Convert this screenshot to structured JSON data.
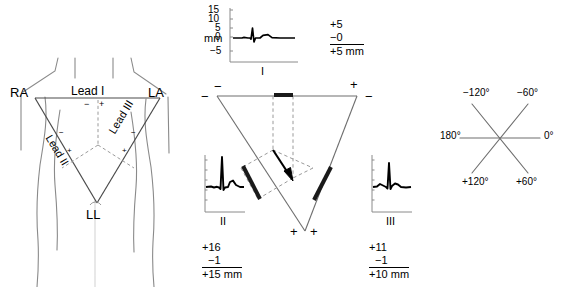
{
  "figure": {
    "type": "medical-diagram"
  },
  "body_panel": {
    "electrodes": {
      "right_arm": "RA",
      "left_arm": "LA",
      "left_leg": "LL"
    },
    "leads": {
      "lead_1": "Lead I",
      "lead_2": "Lead II",
      "lead_3": "Lead III"
    },
    "polarity": {
      "lead1_negative": "−",
      "lead1_positive": "+",
      "lead2_negative": "−",
      "lead2_positive": "+",
      "lead3_negative": "−",
      "lead3_positive": "+"
    }
  },
  "triangle_panel": {
    "corner_signs": {
      "top_left_outer": "−",
      "top_left_upper": "−",
      "top_right_upper": "+",
      "top_right_outer": "−",
      "bottom_left": "+",
      "bottom_right": "+"
    },
    "traces": {
      "lead1": {
        "label": "I",
        "axis_unit": "mm",
        "ticks": [
          "15",
          "10",
          "5",
          "0",
          "−5"
        ],
        "sum": {
          "positive": "+5",
          "negative": "−0",
          "total": "+5 mm"
        }
      },
      "lead2": {
        "label": "II",
        "sum": {
          "positive": "+16",
          "negative": "−1",
          "total": "+15 mm"
        }
      },
      "lead3": {
        "label": "III",
        "sum": {
          "positive": "+11",
          "negative": "−1",
          "total": "+10 mm"
        }
      }
    }
  },
  "axis_panel": {
    "degrees": {
      "minus_120": "−120°",
      "minus_60": "−60°",
      "zero": "0°",
      "plus_60": "+60°",
      "plus_120": "+120°",
      "one_eighty": "180°"
    }
  },
  "colors": {
    "ink": "#000000",
    "body_outline": "#8a8a8a",
    "triangle_line": "#6e6e6e",
    "dashed": "#8a8a8a",
    "axis_line": "#6e6e6e",
    "background": "#ffffff"
  }
}
